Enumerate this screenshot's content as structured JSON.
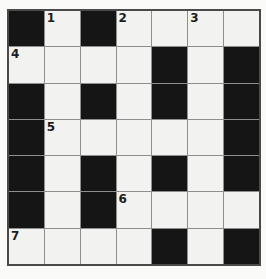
{
  "page": {
    "background": "#fafaf8"
  },
  "puzzle": {
    "kind": "crossword-grid",
    "rows": 7,
    "cols": 7,
    "colors": {
      "black_cell": "#151515",
      "white_cell": "#f2f2f0",
      "grid_line": "#8e8e8e",
      "outer_border": "#4a4a4a",
      "number": "#1c1c1c"
    },
    "visible_numbers": [
      "1",
      "2",
      "3",
      "4",
      "5",
      "6",
      "7"
    ],
    "grid": [
      [
        {
          "fill": "black"
        },
        {
          "fill": "white",
          "number": "1"
        },
        {
          "fill": "black"
        },
        {
          "fill": "white",
          "number": "2"
        },
        {
          "fill": "white"
        },
        {
          "fill": "white",
          "number": "3"
        },
        {
          "fill": "white"
        }
      ],
      [
        {
          "fill": "white",
          "number": "4"
        },
        {
          "fill": "white"
        },
        {
          "fill": "white"
        },
        {
          "fill": "white"
        },
        {
          "fill": "black"
        },
        {
          "fill": "white"
        },
        {
          "fill": "black"
        }
      ],
      [
        {
          "fill": "black"
        },
        {
          "fill": "white"
        },
        {
          "fill": "black"
        },
        {
          "fill": "white"
        },
        {
          "fill": "black"
        },
        {
          "fill": "white"
        },
        {
          "fill": "black"
        }
      ],
      [
        {
          "fill": "black"
        },
        {
          "fill": "white",
          "number": "5"
        },
        {
          "fill": "white"
        },
        {
          "fill": "white"
        },
        {
          "fill": "white"
        },
        {
          "fill": "white"
        },
        {
          "fill": "black"
        }
      ],
      [
        {
          "fill": "black"
        },
        {
          "fill": "white"
        },
        {
          "fill": "black"
        },
        {
          "fill": "white"
        },
        {
          "fill": "black"
        },
        {
          "fill": "white"
        },
        {
          "fill": "black"
        }
      ],
      [
        {
          "fill": "black"
        },
        {
          "fill": "white"
        },
        {
          "fill": "black"
        },
        {
          "fill": "white",
          "number": "6"
        },
        {
          "fill": "white"
        },
        {
          "fill": "white"
        },
        {
          "fill": "white"
        }
      ],
      [
        {
          "fill": "white",
          "number": "7"
        },
        {
          "fill": "white"
        },
        {
          "fill": "white"
        },
        {
          "fill": "white"
        },
        {
          "fill": "black"
        },
        {
          "fill": "white"
        },
        {
          "fill": "black"
        }
      ]
    ]
  }
}
